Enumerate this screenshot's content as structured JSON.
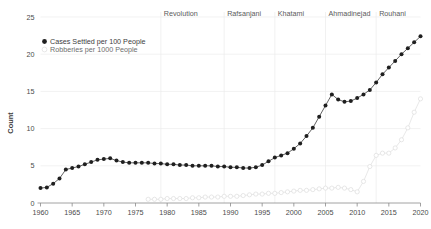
{
  "chart_data": {
    "type": "line",
    "title": "",
    "xlabel": "",
    "ylabel": "Count",
    "xlim": [
      1960,
      2020
    ],
    "ylim": [
      0,
      25
    ],
    "grid": true,
    "legend_position": "top-left-inside",
    "xticks": [
      "1960",
      "1965",
      "1970",
      "1975",
      "1980",
      "1985",
      "1990",
      "1995",
      "2000",
      "2005",
      "2010",
      "2015",
      "2020"
    ],
    "yticks": [
      "0",
      "5",
      "10",
      "15",
      "20",
      "25"
    ],
    "x": [
      1960,
      1961,
      1962,
      1963,
      1964,
      1965,
      1966,
      1967,
      1968,
      1969,
      1970,
      1971,
      1972,
      1973,
      1974,
      1975,
      1976,
      1977,
      1978,
      1979,
      1980,
      1981,
      1982,
      1983,
      1984,
      1985,
      1986,
      1987,
      1988,
      1989,
      1990,
      1991,
      1992,
      1993,
      1994,
      1995,
      1996,
      1997,
      1998,
      1999,
      2000,
      2001,
      2002,
      2003,
      2004,
      2005,
      2006,
      2007,
      2008,
      2009,
      2010,
      2011,
      2012,
      2013,
      2014,
      2015,
      2016,
      2017,
      2018,
      2019,
      2020
    ],
    "series": [
      {
        "name": "Cases Settled per 100 People",
        "marker": "filled-circle",
        "color": "#1f1f1f",
        "values": [
          2.0,
          2.1,
          2.6,
          3.3,
          4.5,
          4.7,
          4.9,
          5.2,
          5.5,
          5.8,
          5.9,
          6.0,
          5.7,
          5.5,
          5.4,
          5.4,
          5.4,
          5.4,
          5.3,
          5.3,
          5.2,
          5.2,
          5.1,
          5.1,
          5.0,
          5.0,
          5.0,
          5.0,
          4.9,
          4.9,
          4.8,
          4.8,
          4.7,
          4.7,
          4.8,
          5.1,
          5.6,
          6.1,
          6.4,
          6.7,
          7.3,
          8.0,
          9.0,
          10.1,
          11.6,
          13.1,
          14.6,
          13.9,
          13.6,
          13.7,
          14.1,
          14.6,
          15.2,
          16.2,
          17.3,
          18.2,
          19.1,
          20.0,
          20.8,
          21.6,
          22.4
        ]
      },
      {
        "name": "Robberies per 1000 People",
        "marker": "open-circle",
        "color": "#dcdcdc",
        "values": [
          null,
          null,
          null,
          null,
          null,
          null,
          null,
          null,
          null,
          null,
          null,
          null,
          null,
          null,
          null,
          null,
          null,
          0.5,
          0.5,
          0.5,
          0.6,
          0.6,
          0.6,
          0.6,
          0.7,
          0.7,
          0.8,
          0.8,
          0.8,
          0.9,
          0.9,
          0.9,
          1.0,
          1.1,
          1.2,
          1.2,
          1.3,
          1.3,
          1.4,
          1.5,
          1.6,
          1.7,
          1.7,
          1.8,
          1.9,
          2.0,
          2.0,
          2.1,
          2.0,
          1.8,
          1.5,
          2.9,
          4.9,
          6.4,
          6.7,
          6.7,
          7.4,
          8.5,
          10.1,
          12.2,
          14.0
        ]
      }
    ],
    "annotations": [
      {
        "label": "Revolution",
        "at_year": 1979,
        "type": "era-divider"
      },
      {
        "label": "Rafsanjani",
        "at_year": 1989,
        "type": "era-divider"
      },
      {
        "label": "Khatami",
        "at_year": 1997,
        "type": "era-divider"
      },
      {
        "label": "Ahmadinejad",
        "at_year": 2005,
        "type": "era-divider"
      },
      {
        "label": "Rouhani",
        "at_year": 2013,
        "type": "era-divider"
      }
    ]
  },
  "legend": {
    "entries": [
      {
        "label": "Cases Settled per 100 People"
      },
      {
        "label": "Robberies per 1000 People"
      }
    ]
  },
  "axes": {
    "y_title": "Count"
  }
}
